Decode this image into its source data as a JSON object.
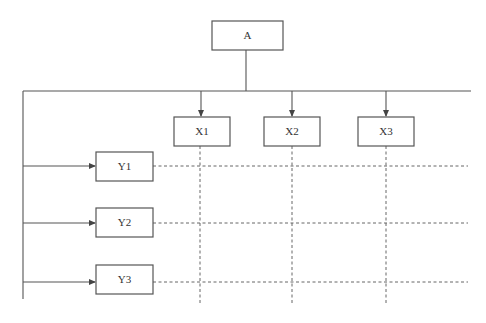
{
  "diagram": {
    "root": {
      "id": "A",
      "label": "A"
    },
    "columns": [
      {
        "id": "X1",
        "label": "X1"
      },
      {
        "id": "X2",
        "label": "X2"
      },
      {
        "id": "X3",
        "label": "X3"
      }
    ],
    "rows": [
      {
        "id": "Y1",
        "label": "Y1"
      },
      {
        "id": "Y2",
        "label": "Y2"
      },
      {
        "id": "Y3",
        "label": "Y3"
      }
    ],
    "edges": [
      {
        "from": "A",
        "to": "X1",
        "style": "solid-arrow"
      },
      {
        "from": "A",
        "to": "X2",
        "style": "solid-arrow"
      },
      {
        "from": "A",
        "to": "X3",
        "style": "solid-arrow"
      },
      {
        "from": "A",
        "to": "Y1",
        "style": "solid-arrow"
      },
      {
        "from": "A",
        "to": "Y2",
        "style": "solid-arrow"
      },
      {
        "from": "A",
        "to": "Y3",
        "style": "solid-arrow"
      }
    ],
    "grid": {
      "style": "dashed",
      "description": "Dashed grid lines extend from X boxes downward and Y boxes rightward, forming a matrix"
    },
    "colors": {
      "line": "#555555",
      "dashed": "#666666",
      "background": "#ffffff"
    }
  }
}
